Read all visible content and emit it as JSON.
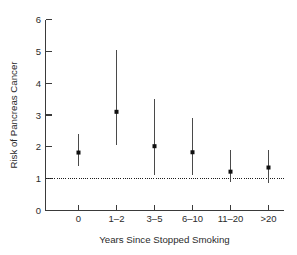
{
  "chart_data": {
    "type": "scatter",
    "title": "",
    "subtitle": "",
    "xlabel": "Years Since Stopped Smoking",
    "ylabel": "Risk of Pancreas Cancer",
    "categories": [
      "0",
      "1–2",
      "3–5",
      "6–10",
      "11–20",
      ">20"
    ],
    "values": [
      1.82,
      3.1,
      2.02,
      1.83,
      1.22,
      1.35
    ],
    "error_low": [
      1.4,
      2.05,
      1.1,
      1.1,
      0.9,
      0.85
    ],
    "error_high": [
      2.4,
      5.05,
      3.5,
      2.9,
      1.9,
      1.9
    ],
    "series": [
      {
        "name": "Risk of Pancreas Cancer",
        "values": [
          1.82,
          3.1,
          2.02,
          1.83,
          1.22,
          1.35
        ],
        "error_low": [
          1.4,
          2.05,
          1.1,
          1.1,
          0.9,
          0.85
        ],
        "error_high": [
          2.4,
          5.05,
          3.5,
          2.9,
          1.9,
          1.9
        ]
      }
    ],
    "points": [
      {
        "category": "0",
        "value": 1.82,
        "low": 1.4,
        "high": 2.4
      },
      {
        "category": "1–2",
        "value": 3.1,
        "low": 2.05,
        "high": 5.05
      },
      {
        "category": "3–5",
        "value": 2.02,
        "low": 1.1,
        "high": 3.5
      },
      {
        "category": "6–10",
        "value": 1.83,
        "low": 1.1,
        "high": 2.9
      },
      {
        "category": "11–20",
        "value": 1.22,
        "low": 0.9,
        "high": 1.9
      },
      {
        "category": ">20",
        "value": 1.35,
        "low": 0.85,
        "high": 1.9
      }
    ],
    "ylim": [
      0,
      6
    ],
    "yticks": [
      0,
      1,
      2,
      3,
      4,
      5,
      6
    ],
    "ytick_labels": [
      "0",
      "1",
      "2",
      "3",
      "4",
      "5",
      "6"
    ],
    "xtick_labels": [
      "0",
      "1–2",
      "3–5",
      "6–10",
      "11–20",
      ">20"
    ],
    "grid": false,
    "legend": false,
    "legend_position": "none",
    "reference_line": {
      "value": 1,
      "style": "dotted",
      "label": ""
    },
    "marker_style": "filled-square",
    "error_bar_style": "vertical-line",
    "colors": {
      "axis": "#3a3a3a",
      "marker": "#101010",
      "whisker": "#4a4a4a",
      "reference_line": "#1d1d1d",
      "background": "#ffffff",
      "text": "#2b2b2b"
    }
  }
}
